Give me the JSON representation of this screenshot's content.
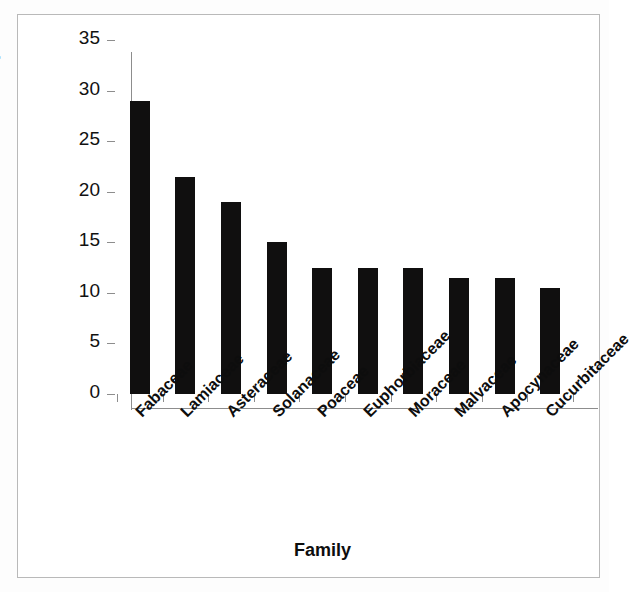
{
  "chart_data": {
    "type": "bar",
    "title": "",
    "xlabel": "Family",
    "ylabel": "Number of species",
    "categories": [
      "Fabaceae",
      "Lamiaceae",
      "Asteraceae",
      "Solanaceae",
      "Poaceae",
      "Euphorbiaceae",
      "Moraceae",
      "Malvaceae",
      "Apocynaceae",
      "Cucurbitaceae"
    ],
    "values": [
      29,
      21.5,
      19,
      15,
      12.5,
      12.5,
      12.5,
      11.5,
      11.5,
      10.5
    ],
    "ylim": [
      0,
      35
    ],
    "ytick_labels": [
      "0",
      "5",
      "10",
      "15",
      "20",
      "25",
      "30",
      "35"
    ],
    "ytick_values": [
      0,
      5,
      10,
      15,
      20,
      25,
      30,
      35
    ],
    "grid": false,
    "legend": false,
    "bar_color": "#100f0f",
    "axis_color": "#8d8d8d",
    "background_color": "#ffffff",
    "frame_color": "#b9b9b9",
    "xtick_label_rotation_deg": -45
  }
}
